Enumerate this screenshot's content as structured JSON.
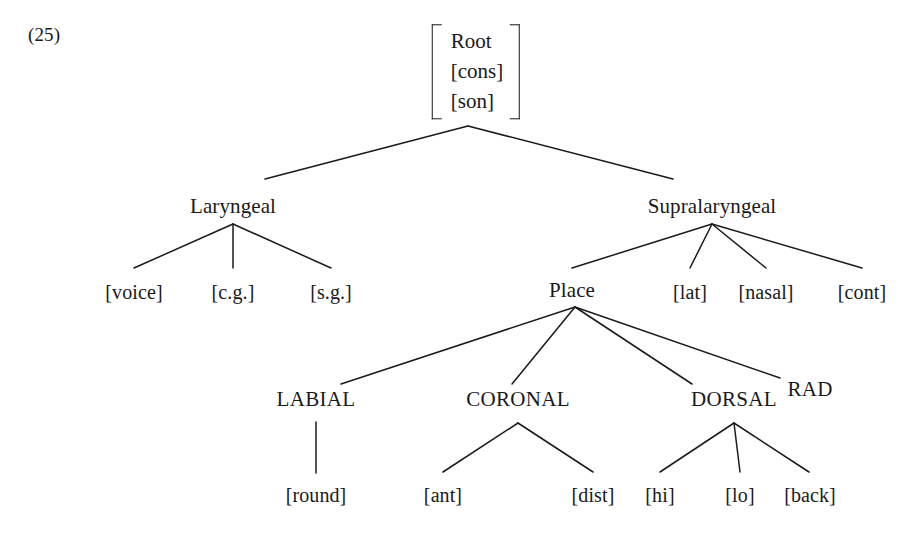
{
  "figure": {
    "number": "(25)",
    "background_color": "#ffffff",
    "line_color": "#1a1a1a",
    "text_color": "#1a1a1a"
  },
  "root": {
    "bracket_open": "[",
    "bracket_close": "]",
    "rows": [
      "Root",
      "[cons]",
      "[son]"
    ]
  },
  "tree": {
    "tier1": {
      "laryngeal": "Laryngeal",
      "supralaryngeal": "Supralaryngeal"
    },
    "laryngeal_features": [
      "[voice]",
      "[c.g.]",
      "[s.g.]"
    ],
    "supralaryngeal_children": [
      "Place",
      "[lat]",
      "[nasal]",
      "[cont]"
    ],
    "place_articulators": [
      "LABIAL",
      "CORONAL",
      "DORSAL",
      "RAD"
    ],
    "labial_features": [
      "[round]"
    ],
    "coronal_features": [
      "[ant]",
      "[dist]"
    ],
    "dorsal_features": [
      "[hi]",
      "[lo]",
      "[back]"
    ]
  }
}
